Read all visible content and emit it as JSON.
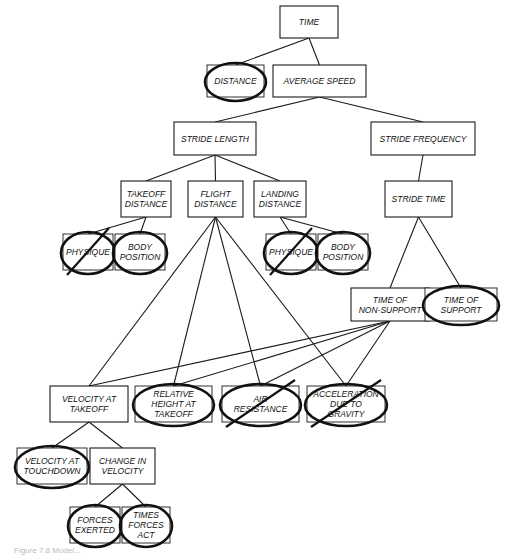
{
  "diagram": {
    "nodes": [
      {
        "id": "time",
        "lines": [
          "TIME"
        ],
        "circled": false,
        "crossed": false
      },
      {
        "id": "distance",
        "lines": [
          "DISTANCE"
        ],
        "circled": true,
        "crossed": false
      },
      {
        "id": "average_speed",
        "lines": [
          "AVERAGE SPEED"
        ],
        "circled": false,
        "crossed": false
      },
      {
        "id": "stride_length",
        "lines": [
          "STRIDE LENGTH"
        ],
        "circled": false,
        "crossed": false
      },
      {
        "id": "stride_frequency",
        "lines": [
          "STRIDE FREQUENCY"
        ],
        "circled": false,
        "crossed": false
      },
      {
        "id": "takeoff_distance",
        "lines": [
          "TAKEOFF",
          "DISTANCE"
        ],
        "circled": false,
        "crossed": false
      },
      {
        "id": "flight_distance",
        "lines": [
          "FLIGHT",
          "DISTANCE"
        ],
        "circled": false,
        "crossed": false
      },
      {
        "id": "landing_distance",
        "lines": [
          "LANDING",
          "DISTANCE"
        ],
        "circled": false,
        "crossed": false
      },
      {
        "id": "stride_time",
        "lines": [
          "STRIDE TIME"
        ],
        "circled": false,
        "crossed": false
      },
      {
        "id": "physique_1",
        "lines": [
          "PHYSIQUE"
        ],
        "circled": true,
        "crossed": true
      },
      {
        "id": "body_position_1",
        "lines": [
          "BODY",
          "POSITION"
        ],
        "circled": true,
        "crossed": false
      },
      {
        "id": "physique_2",
        "lines": [
          "PHYSIQUE"
        ],
        "circled": true,
        "crossed": true
      },
      {
        "id": "body_position_2",
        "lines": [
          "BODY",
          "POSITION"
        ],
        "circled": true,
        "crossed": false
      },
      {
        "id": "time_non_support",
        "lines": [
          "TIME OF",
          "NON-SUPPORT"
        ],
        "circled": false,
        "crossed": false
      },
      {
        "id": "time_support",
        "lines": [
          "TIME OF",
          "SUPPORT"
        ],
        "circled": true,
        "crossed": false
      },
      {
        "id": "velocity_takeoff",
        "lines": [
          "VELOCITY AT",
          "TAKEOFF"
        ],
        "circled": false,
        "crossed": false
      },
      {
        "id": "relative_height",
        "lines": [
          "RELATIVE",
          "HEIGHT AT",
          "TAKEOFF"
        ],
        "circled": true,
        "crossed": false
      },
      {
        "id": "air_resistance",
        "lines": [
          "AIR",
          "RESISTANCE"
        ],
        "circled": true,
        "crossed": true
      },
      {
        "id": "accel_gravity",
        "lines": [
          "ACCELERATION",
          "DUE TO",
          "GRAVITY"
        ],
        "circled": true,
        "crossed": true
      },
      {
        "id": "velocity_touchdown",
        "lines": [
          "VELOCITY AT",
          "TOUCHDOWN"
        ],
        "circled": true,
        "crossed": false
      },
      {
        "id": "change_velocity",
        "lines": [
          "CHANGE IN",
          "VELOCITY"
        ],
        "circled": false,
        "crossed": false
      },
      {
        "id": "forces_exerted",
        "lines": [
          "FORCES",
          "EXERTED"
        ],
        "circled": true,
        "crossed": false
      },
      {
        "id": "times_forces_act",
        "lines": [
          "TIMES",
          "FORCES",
          "ACT"
        ],
        "circled": true,
        "crossed": false
      }
    ],
    "edges": [
      [
        "time",
        "distance"
      ],
      [
        "time",
        "average_speed"
      ],
      [
        "average_speed",
        "stride_length"
      ],
      [
        "average_speed",
        "stride_frequency"
      ],
      [
        "stride_length",
        "takeoff_distance"
      ],
      [
        "stride_length",
        "flight_distance"
      ],
      [
        "stride_length",
        "landing_distance"
      ],
      [
        "stride_frequency",
        "stride_time"
      ],
      [
        "takeoff_distance",
        "physique_1"
      ],
      [
        "takeoff_distance",
        "body_position_1"
      ],
      [
        "landing_distance",
        "physique_2"
      ],
      [
        "landing_distance",
        "body_position_2"
      ],
      [
        "stride_time",
        "time_non_support"
      ],
      [
        "stride_time",
        "time_support"
      ],
      [
        "flight_distance",
        "velocity_takeoff"
      ],
      [
        "flight_distance",
        "relative_height"
      ],
      [
        "flight_distance",
        "air_resistance"
      ],
      [
        "flight_distance",
        "accel_gravity"
      ],
      [
        "time_non_support",
        "velocity_takeoff"
      ],
      [
        "time_non_support",
        "relative_height"
      ],
      [
        "time_non_support",
        "air_resistance"
      ],
      [
        "time_non_support",
        "accel_gravity"
      ],
      [
        "velocity_takeoff",
        "velocity_touchdown"
      ],
      [
        "velocity_takeoff",
        "change_velocity"
      ],
      [
        "change_velocity",
        "forces_exerted"
      ],
      [
        "change_velocity",
        "times_forces_act"
      ]
    ],
    "caption": "Figure 7.8  Model..."
  }
}
